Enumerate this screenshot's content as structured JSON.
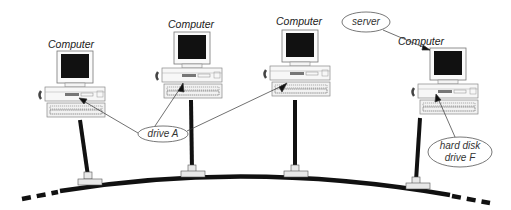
{
  "diagram": {
    "type": "bus-network",
    "computers": [
      {
        "id": "pc1",
        "label": "Computer"
      },
      {
        "id": "pc2",
        "label": "Computer"
      },
      {
        "id": "pc3",
        "label": "Computer"
      },
      {
        "id": "pc4",
        "label": "Computer",
        "role": "server"
      }
    ],
    "callouts": {
      "server": "server",
      "drive_a": "drive A",
      "hard_disk_line1": "hard disk",
      "hard_disk_line2": "drive F"
    },
    "colors": {
      "cable": "#111111",
      "monitor_screen": "#111111",
      "outline": "#555555",
      "background": "#ffffff"
    }
  }
}
